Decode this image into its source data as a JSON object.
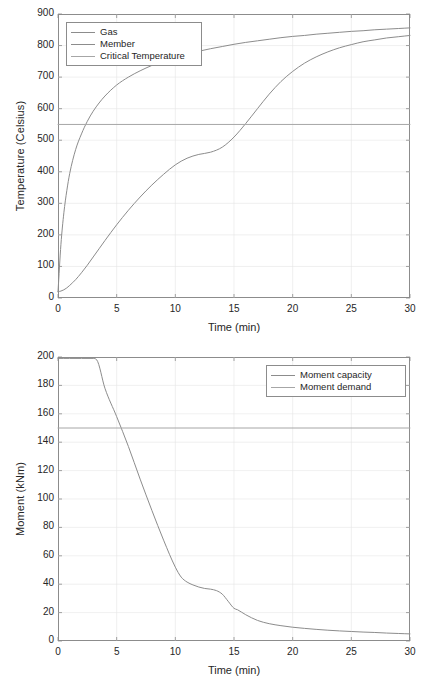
{
  "figure": {
    "background_color": "#ffffff",
    "axis_color": "#8c8c8c",
    "grid_color": "#e6e6e6",
    "text_color": "#262626"
  },
  "chart_data": [
    {
      "id": "temperature",
      "type": "line",
      "title": "",
      "xlabel": "Time (min)",
      "ylabel": "Temperature (Celsius)",
      "xlim": [
        0,
        30
      ],
      "ylim": [
        0,
        900
      ],
      "xticks": [
        0,
        5,
        10,
        15,
        20,
        25,
        30
      ],
      "yticks": [
        0,
        100,
        200,
        300,
        400,
        500,
        600,
        700,
        800,
        900
      ],
      "xtick_labels": [
        "0",
        "5",
        "10",
        "15",
        "20",
        "25",
        "30"
      ],
      "ytick_labels": [
        "0",
        "100",
        "200",
        "300",
        "400",
        "500",
        "600",
        "700",
        "800",
        "900"
      ],
      "grid": true,
      "legend_position": "upper-left",
      "legend": [
        "Gas",
        "Member",
        "Critical Temperature"
      ],
      "x": [
        0,
        0.25,
        0.5,
        0.75,
        1,
        1.5,
        2,
        2.5,
        3,
        3.5,
        4,
        5,
        6,
        7,
        8,
        9,
        10,
        11,
        12,
        13,
        14,
        15,
        16,
        17,
        18,
        19,
        20,
        21,
        22,
        23,
        24,
        25,
        26,
        27,
        28,
        29,
        30
      ],
      "series": [
        {
          "name": "Gas",
          "color": "#8c8c8c",
          "values": [
            20,
            170,
            270,
            340,
            395,
            470,
            520,
            560,
            592,
            618,
            640,
            675,
            700,
            720,
            737,
            751,
            763,
            773,
            782,
            790,
            797,
            804,
            810,
            815,
            820,
            825,
            829,
            832,
            836,
            839,
            842,
            845,
            847,
            850,
            852,
            854,
            856
          ]
        },
        {
          "name": "Member",
          "color": "#8c8c8c",
          "values": [
            20,
            22,
            26,
            32,
            40,
            58,
            80,
            104,
            130,
            156,
            182,
            232,
            278,
            320,
            358,
            392,
            422,
            443,
            455,
            462,
            478,
            510,
            553,
            600,
            646,
            686,
            718,
            744,
            764,
            780,
            793,
            803,
            812,
            818,
            824,
            828,
            832
          ]
        },
        {
          "name": "Critical Temperature",
          "color": "#a6a6a6",
          "constant": 550,
          "values": [
            550,
            550,
            550,
            550,
            550,
            550,
            550,
            550,
            550,
            550,
            550,
            550,
            550,
            550,
            550,
            550,
            550,
            550,
            550,
            550,
            550,
            550,
            550,
            550,
            550,
            550,
            550,
            550,
            550,
            550,
            550,
            550,
            550,
            550,
            550,
            550,
            550
          ]
        }
      ]
    },
    {
      "id": "moment",
      "type": "line",
      "title": "",
      "xlabel": "Time (min)",
      "ylabel": "Moment (kNm)",
      "xlim": [
        0,
        30
      ],
      "ylim": [
        0,
        200
      ],
      "xticks": [
        0,
        5,
        10,
        15,
        20,
        25,
        30
      ],
      "yticks": [
        0,
        20,
        40,
        60,
        80,
        100,
        120,
        140,
        160,
        180,
        200
      ],
      "xtick_labels": [
        "0",
        "5",
        "10",
        "15",
        "20",
        "25",
        "30"
      ],
      "ytick_labels": [
        "0",
        "20",
        "40",
        "60",
        "80",
        "100",
        "120",
        "140",
        "160",
        "180",
        "200"
      ],
      "grid": true,
      "legend_position": "upper-right",
      "legend": [
        "Moment capacity",
        "Moment demand"
      ],
      "x": [
        0,
        1,
        2,
        3,
        3.3,
        4,
        5,
        6,
        7,
        8,
        9,
        10,
        10.5,
        11,
        11.5,
        12,
        12.5,
        13,
        13.5,
        14,
        14.5,
        15,
        15.3,
        16,
        17,
        18,
        19,
        20,
        21,
        22,
        23,
        24,
        25,
        26,
        27,
        28,
        29,
        30
      ],
      "series": [
        {
          "name": "Moment capacity",
          "color": "#8c8c8c",
          "values": [
            199,
            199,
            199,
            199,
            198,
            178,
            158,
            137,
            114,
            92,
            71,
            52,
            45,
            41.5,
            39.5,
            38,
            37,
            36.5,
            35.5,
            33,
            28,
            23,
            22,
            18.5,
            14.5,
            12.2,
            10.8,
            9.7,
            8.9,
            8.2,
            7.6,
            7.1,
            6.7,
            6.3,
            6.0,
            5.6,
            5.3,
            5.0
          ]
        },
        {
          "name": "Moment demand",
          "color": "#a6a6a6",
          "constant": 150,
          "values": [
            150,
            150,
            150,
            150,
            150,
            150,
            150,
            150,
            150,
            150,
            150,
            150,
            150,
            150,
            150,
            150,
            150,
            150,
            150,
            150,
            150,
            150,
            150,
            150,
            150,
            150,
            150,
            150,
            150,
            150,
            150,
            150,
            150,
            150,
            150,
            150,
            150,
            150
          ]
        }
      ]
    }
  ]
}
